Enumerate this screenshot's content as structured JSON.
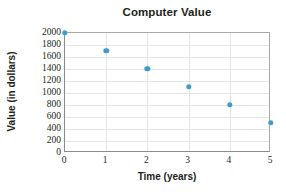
{
  "chart_data": {
    "type": "scatter",
    "title": "Computer Value",
    "xlabel": "Time (years)",
    "ylabel": "Value (in dollars)",
    "x": [
      0,
      1,
      2,
      3,
      4,
      5
    ],
    "values": [
      2000,
      1700,
      1400,
      1100,
      800,
      500
    ],
    "points": [
      {
        "x": 0,
        "y": 2000
      },
      {
        "x": 1,
        "y": 1700
      },
      {
        "x": 2,
        "y": 1400
      },
      {
        "x": 3,
        "y": 1100
      },
      {
        "x": 4,
        "y": 800
      },
      {
        "x": 5,
        "y": 500
      }
    ],
    "xlim": [
      0,
      5
    ],
    "ylim": [
      0,
      2000
    ],
    "xticks": [
      "0",
      "1",
      "2",
      "3",
      "4",
      "5"
    ],
    "yticks": [
      "0",
      "200",
      "400",
      "600",
      "800",
      "1000",
      "1200",
      "1400",
      "1600",
      "1800",
      "2000"
    ],
    "ytick_values": [
      0,
      200,
      400,
      600,
      800,
      1000,
      1200,
      1400,
      1600,
      1800,
      2000
    ],
    "xtick_values": [
      0,
      1,
      2,
      3,
      4,
      5
    ],
    "grid": true,
    "legend": null,
    "marker_color": "#3f9bcd",
    "grid_color": "#e2e6ea",
    "axis_color": "#8c8c8c",
    "text_color": "#231f20"
  }
}
